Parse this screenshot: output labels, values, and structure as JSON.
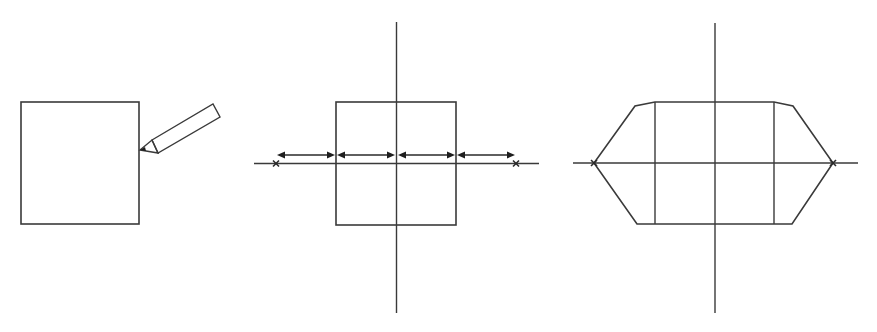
{
  "diagram": {
    "description": "Three-panel geometric construction: a square being drawn with a pencil, the square on crossed axes with four equal arrow segments along the horizontal axis extending to two X points, and the resulting hexagon-like shape connecting the square to the two X points.",
    "stroke_color": "#3a3a3a",
    "background": "#ffffff",
    "panels": [
      {
        "id": "panel-1",
        "label": "draw-square",
        "elements": [
          "square",
          "pencil"
        ]
      },
      {
        "id": "panel-2",
        "label": "measure-along-axis",
        "elements": [
          "vertical-axis",
          "horizontal-axis",
          "square",
          "arrow-segments",
          "x-marks"
        ],
        "arrow_segments": 4,
        "x_marks": 2
      },
      {
        "id": "panel-3",
        "label": "connect-to-points",
        "elements": [
          "vertical-axis",
          "horizontal-axis",
          "square",
          "hexagon-outline",
          "x-marks"
        ],
        "x_marks": 2
      }
    ]
  }
}
